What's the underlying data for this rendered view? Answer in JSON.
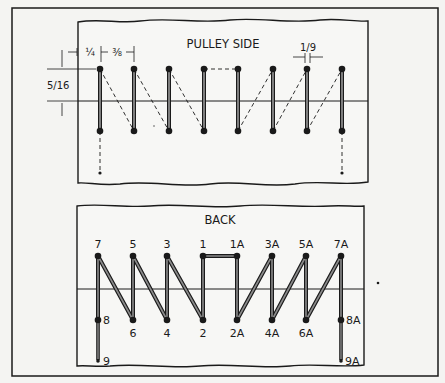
{
  "figure": {
    "outer_frame": true,
    "panels": [
      {
        "id": "pulley-side",
        "title": "PULLEY SIDE",
        "dimensions": {
          "edge_offset": "¼",
          "hole_spacing": "⅜",
          "wire_gap": "1/9",
          "row_spacing": "5/16"
        }
      },
      {
        "id": "back",
        "title": "BACK",
        "top_labels": [
          "7",
          "5",
          "3",
          "1",
          "1A",
          "3A",
          "5A",
          "7A"
        ],
        "bottom_labels": [
          "8",
          "6",
          "4",
          "2",
          "2A",
          "4A",
          "6A",
          "8A"
        ],
        "tail_labels": [
          "9",
          "9A"
        ]
      }
    ]
  },
  "colors": {
    "ink": "#1a1a1a",
    "lace": "#7a7a7a",
    "paper": "#f4f4f2"
  }
}
